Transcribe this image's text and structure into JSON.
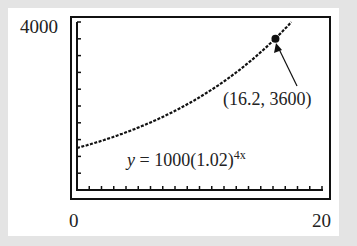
{
  "chart_data": {
    "type": "line",
    "title": "",
    "xlabel": "",
    "ylabel": "",
    "xlim": [
      0,
      20
    ],
    "ylim": [
      0,
      4000
    ],
    "x_tick_labels": [
      "0",
      "20"
    ],
    "y_tick_labels": [
      "4000"
    ],
    "x_ticks_count": 20,
    "y_ticks_count": 10,
    "grid": false,
    "series": [
      {
        "name": "y = 1000(1.02)^(4x)",
        "x": [
          0,
          2,
          4,
          6,
          8,
          10,
          12,
          14,
          16,
          16.2,
          17.5
        ],
        "y": [
          1000,
          1172,
          1373,
          1608,
          1885,
          2208,
          2587,
          3031,
          3551,
          3600,
          3996
        ]
      }
    ],
    "annotations": [
      {
        "text": "(16.2, 3600)",
        "x": 16.2,
        "y": 3600,
        "type": "point-with-arrow"
      },
      {
        "text": "y = 1000(1.02)^4x",
        "type": "equation-label"
      }
    ]
  },
  "labels": {
    "ymax": "4000",
    "xmin": "0",
    "xmax": "20",
    "point": "(16.2, 3600)",
    "eq_main": "y = 1000(1.02)",
    "eq_exp": "4x"
  }
}
